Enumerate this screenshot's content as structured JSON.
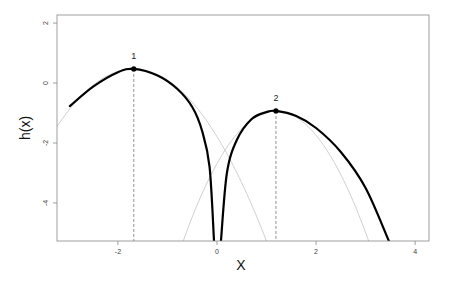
{
  "chart_data": {
    "type": "line",
    "title": "",
    "xlabel": "X",
    "ylabel": "h(x)",
    "xlim": [
      -3.23,
      4.28
    ],
    "ylim": [
      -5.27,
      2.27
    ],
    "grid": false,
    "legend": null,
    "x_ticks": [
      -2,
      0,
      2,
      4
    ],
    "x_tick_labels": [
      "-2",
      "0",
      "2",
      "4"
    ],
    "y_ticks": [
      2,
      0,
      -2,
      -4
    ],
    "y_tick_labels": [
      "2",
      "0",
      "-2",
      "-4"
    ],
    "series": [
      {
        "name": "h(x)",
        "style": "thick black",
        "formula": "log|exp(h1(x)) - exp(h2(x))|",
        "x_range": [
          -2.97,
          3.47
        ],
        "points": [
          [
            -2.97,
            -0.77
          ],
          [
            -2.5,
            -0.12
          ],
          [
            -2.0,
            0.36
          ],
          [
            -1.68,
            0.47
          ],
          [
            -1.2,
            0.25
          ],
          [
            -0.8,
            -0.2
          ],
          [
            -0.5,
            -0.8
          ],
          [
            -0.3,
            -1.6
          ],
          [
            -0.15,
            -2.8
          ],
          [
            -0.06,
            -5.27
          ],
          [
            0.08,
            -5.27
          ],
          [
            0.2,
            -3.0
          ],
          [
            0.4,
            -1.9
          ],
          [
            0.7,
            -1.2
          ],
          [
            1.0,
            -0.97
          ],
          [
            1.19,
            -0.93
          ],
          [
            1.6,
            -1.1
          ],
          [
            2.0,
            -1.5
          ],
          [
            2.5,
            -2.3
          ],
          [
            3.0,
            -3.5
          ],
          [
            3.47,
            -5.27
          ]
        ]
      },
      {
        "name": "component 1",
        "style": "thin light gray",
        "peak": [
          -1.68,
          0.47
        ],
        "curvature": 0.8
      },
      {
        "name": "component 2",
        "style": "thin light gray",
        "peak": [
          1.19,
          -0.93
        ],
        "curvature": 1.24
      }
    ],
    "annotations": [
      {
        "label": "1",
        "x": -1.68,
        "y": 0.47,
        "marker": "filled circle",
        "dashed_drop_line": true
      },
      {
        "label": "2",
        "x": 1.19,
        "y": -0.93,
        "marker": "filled circle",
        "dashed_drop_line": true
      }
    ]
  },
  "plot": {
    "box": {
      "left": 57,
      "top": 15,
      "right": 429,
      "bottom": 241
    },
    "colors": {
      "main_curve": "#000000",
      "component_curve": "#d0d0d0",
      "box": "#888888",
      "drop_line": "#777777"
    }
  }
}
